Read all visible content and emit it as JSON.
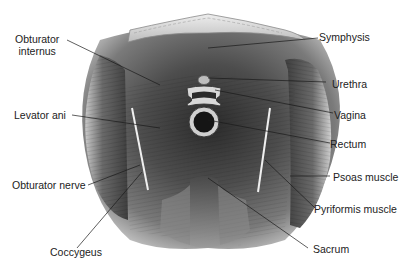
{
  "figure": {
    "labels": {
      "obturator_internus": "Obturator internus",
      "obturator_internus_line1": "Obturator",
      "obturator_internus_line2": "internus",
      "levator_ani": "Levator ani",
      "obturator_nerve": "Obturator nerve",
      "coccygeus": "Coccygeus",
      "symphysis": "Symphysis",
      "urethra": "Urethra",
      "vagina": "Vagina",
      "rectum": "Rectum",
      "psoas_muscle": "Psoas muscle",
      "pyriformis_muscle": "Pyriformis muscle",
      "sacrum": "Sacrum"
    },
    "colors": {
      "background": "#ffffff",
      "muscle_dark": "#3a3a3a",
      "muscle_mid": "#6e6e6e",
      "muscle_light": "#a9a9a9",
      "bone_light": "#d9d9d9",
      "leader_line": "#1a1a1a",
      "nerve": "#e8e8e8"
    }
  }
}
